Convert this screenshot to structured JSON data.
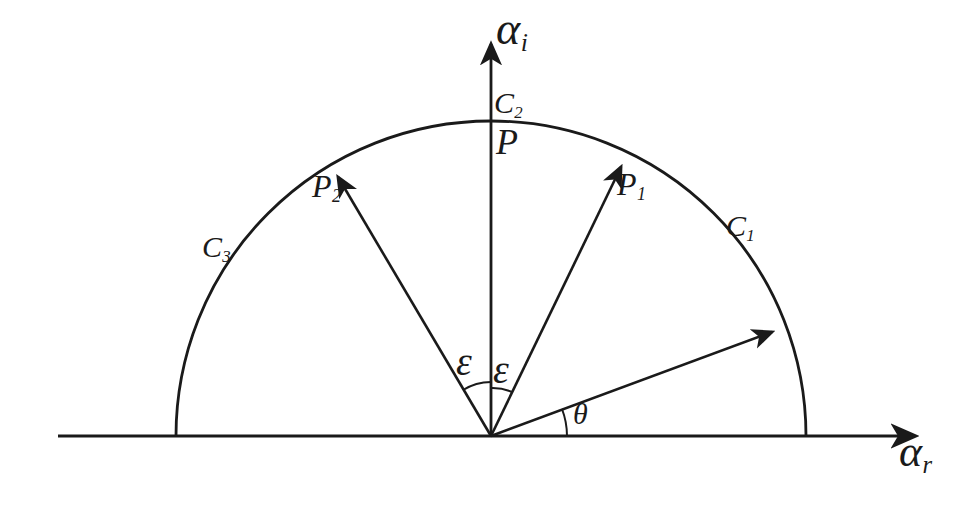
{
  "figure": {
    "type": "math-diagram",
    "colors": {
      "background": "#ffffff",
      "ink": "#1a1a1a"
    },
    "labels": {
      "alpha_i": {
        "main": "α",
        "sub": "i"
      },
      "alpha_r": {
        "main": "α",
        "sub": "r"
      },
      "C1": {
        "main": "C",
        "sub": "1"
      },
      "C2": {
        "main": "C",
        "sub": "2"
      },
      "C3": {
        "main": "C",
        "sub": "3"
      },
      "P": {
        "main": "P",
        "sub": ""
      },
      "P1": {
        "main": "P",
        "sub": "1"
      },
      "P2": {
        "main": "P",
        "sub": "2"
      },
      "epsilon_left": "ε",
      "epsilon_right": "ε",
      "theta": "θ"
    }
  }
}
